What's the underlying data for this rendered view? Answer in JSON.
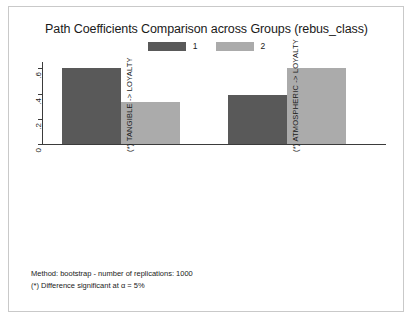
{
  "chart_data": {
    "type": "bar",
    "title": "Path Coefficients Comparison across Groups (rebus_class)",
    "categories": [
      "(*) TANGIBLE -> LOYALTY",
      "(*) ATMOSPHERIC -> LOYALTY"
    ],
    "series": [
      {
        "name": "1",
        "values": [
          0.6,
          0.39
        ],
        "color": "#595959"
      },
      {
        "name": "2",
        "values": [
          0.33,
          0.6
        ],
        "color": "#ababab"
      }
    ],
    "xlabel": "",
    "ylabel": "",
    "ylim": [
      0,
      0.65
    ],
    "yticks": [
      0,
      0.2,
      0.4,
      0.6
    ],
    "ytick_labels": [
      "0",
      ".2",
      ".4",
      ".6"
    ],
    "grid": false,
    "legend_position": "top-center"
  },
  "legend": {
    "entries": [
      {
        "label": "1",
        "color": "#595959"
      },
      {
        "label": "2",
        "color": "#ababab"
      }
    ]
  },
  "axis": {
    "ytick_labels": [
      "0",
      ".2",
      ".4",
      ".6"
    ]
  },
  "footer": {
    "line1": "Method: bootstrap - number of replications: 1000",
    "line2": "(*) Difference significant at α = 5%"
  },
  "colors": {
    "group1": "#595959",
    "group2": "#ababab",
    "axis": "#3b3b3b",
    "border": "#c9c9c9",
    "text": "#1a1a1a",
    "background": "#ffffff"
  }
}
